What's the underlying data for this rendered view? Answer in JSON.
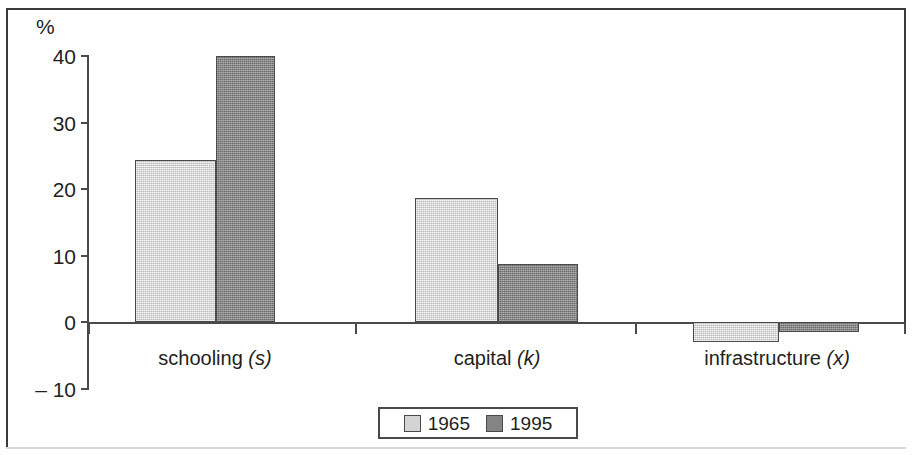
{
  "chart_data": {
    "type": "bar",
    "title": "",
    "subtitle": "",
    "xlabel": "",
    "ylabel": "%",
    "ylim": [
      -10,
      40
    ],
    "yticks": [
      40,
      30,
      20,
      10,
      0,
      -10
    ],
    "ytick_labels": [
      "40",
      "30",
      "20",
      "10",
      "0",
      "– 10"
    ],
    "grid": false,
    "legend_position": "bottom-center",
    "categories": [
      "schooling (s)",
      "capital (k)",
      "infrastructure (x)"
    ],
    "category_labels": [
      {
        "text": "schooling",
        "italic_suffix": "(s)"
      },
      {
        "text": "capital",
        "italic_suffix": "(k)"
      },
      {
        "text": "infrastructure",
        "italic_suffix": "(x)"
      }
    ],
    "series": [
      {
        "name": "1965",
        "color": "#d4d4d4",
        "values": [
          24.3,
          18.6,
          -3.0
        ]
      },
      {
        "name": "1995",
        "color": "#848484",
        "values": [
          40.0,
          8.7,
          -1.5
        ]
      }
    ]
  },
  "axis": {
    "percent_symbol": "%"
  },
  "legend": {
    "items": [
      {
        "label": "1965",
        "swatch": "light-swatch"
      },
      {
        "label": "1995",
        "swatch": "dark-swatch"
      }
    ]
  }
}
